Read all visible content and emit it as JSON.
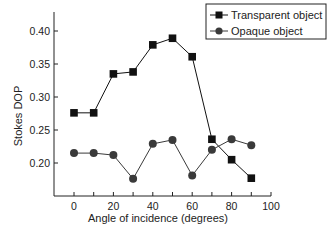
{
  "chart_data": {
    "type": "line",
    "title": "",
    "xlabel": "Angle of incidence (degrees)",
    "ylabel": "Stokes DOP",
    "xlim": [
      -10,
      100
    ],
    "ylim": [
      0.17,
      0.42
    ],
    "xticks": [
      0,
      10,
      20,
      30,
      40,
      50,
      60,
      70,
      80,
      90,
      100
    ],
    "xtick_labels": [
      "0",
      "20",
      "40",
      "60",
      "80",
      "100"
    ],
    "xtick_label_values": [
      0,
      20,
      40,
      60,
      80,
      100
    ],
    "yticks": [
      0.2,
      0.25,
      0.3,
      0.35,
      0.4
    ],
    "ytick_labels": [
      "0.20",
      "0.25",
      "0.30",
      "0.35",
      "0.40"
    ],
    "grid": false,
    "legend_position": "upper right",
    "x": [
      0,
      10,
      20,
      30,
      40,
      50,
      60,
      70,
      80,
      90
    ],
    "series": [
      {
        "name": "Transparent object",
        "marker": "square",
        "color": "#111111",
        "values": [
          0.276,
          0.276,
          0.335,
          0.338,
          0.379,
          0.389,
          0.361,
          0.236,
          0.205,
          0.177
        ]
      },
      {
        "name": "Opaque object",
        "marker": "circle",
        "color": "#3a3a3a",
        "values": [
          0.215,
          0.215,
          0.212,
          0.176,
          0.229,
          0.235,
          0.181,
          0.22,
          0.236,
          0.227
        ]
      }
    ]
  },
  "legend": {
    "items": [
      "Transparent object",
      "Opaque object"
    ]
  }
}
